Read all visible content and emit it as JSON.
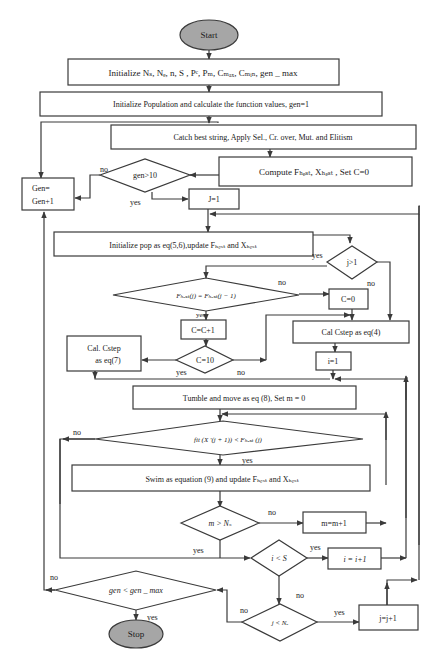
{
  "colors": {
    "terminal_fill": "#a6a6a6",
    "stroke": "#3a3a3a",
    "background": "#ffffff"
  },
  "nodes": {
    "start": "Start",
    "init_params": "Initialize Nₛ, Nₑ, n, S , Pᶜ, Pₘ, Cₘₐₓ, Cₘᵢₙ, gen _ max",
    "init_pop": "Initialize Population and calculate the function values, gen=1",
    "catch_best": "Catch best string, Apply Sel., Cr. over, Mut. and Elitism",
    "compute": "Compute Fₕₑₛₜ, Xₕₑₛₜ , Set C=0",
    "gen_check": "gen>10",
    "gen_inc_1": "Gen=",
    "gen_inc_2": "Gen+1",
    "j1": "J=1",
    "init_pop_eq": "Initialize pop as eq(5,6),update Fₕₑₛₜ and Xₕₑₛₜ",
    "j_gt_1": "j>1",
    "fbest_eq": "Fₕₑₛₜ(j) = Fₕₑₛₜ(j − 1)",
    "c0": "C=0",
    "c_inc": "C=C+1",
    "cal_cstep4": "Cal Cstep as eq(4)",
    "cal_cstep7_1": "Cal. Cstep",
    "cal_cstep7_2": "as eq(7)",
    "c10": "C=10",
    "i1": "i=1",
    "tumble": "Tumble and move as eq (8), Set m = 0",
    "fit_check": "fit (X ′(j + 1)) < Fₕₑₛₜ (j)",
    "swim": "Swim as equation (9) and update  Fₕₑₛₜ and Xₕₑₛₜ",
    "m_check": "m > Nₛ",
    "m_inc": "m=m+1",
    "i_check": "i < S",
    "i_inc": "i = i+1",
    "gen_max_check": "gen < gen _ max",
    "j_check": "j < Nₑ",
    "j_inc": "j=j+1",
    "stop": "Stop"
  },
  "edge_labels": {
    "gen_no": "no",
    "gen_yes": "yes",
    "jgt1_yes": "yes",
    "jgt1_no": "no",
    "fbest_no": "no",
    "fbest_yes": "yes",
    "c10_yes": "yes",
    "c10_no": "no",
    "fit_no": "no",
    "fit_yes": "yes",
    "m_no": "no",
    "m_yes": "yes",
    "i_yes": "yes",
    "i_no": "no",
    "j_no_left": "no",
    "j_yes": "yes",
    "genmax_no": "no",
    "genmax_yes": "yes"
  }
}
